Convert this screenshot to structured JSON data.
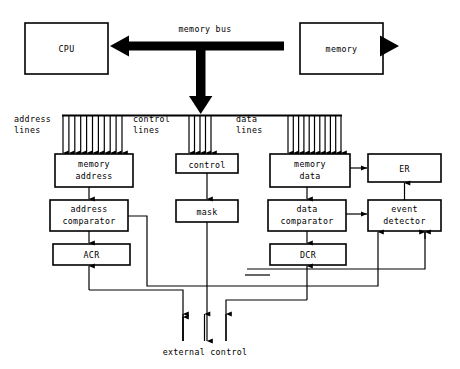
{
  "diagram": {
    "colors": {
      "ink": "#000000",
      "paper": "#ffffff"
    },
    "top": {
      "cpu_label": "CPU",
      "memory_label": "memory",
      "bus_label": "memory bus"
    },
    "bus_groups": [
      {
        "id": "address",
        "label_line1": "address",
        "label_line2": "lines",
        "count": 11
      },
      {
        "id": "control",
        "label_line1": "control",
        "label_line2": "lines",
        "count": 5
      },
      {
        "id": "data",
        "label_line1": "data",
        "label_line2": "lines",
        "count": 11
      }
    ],
    "boxes": {
      "memory_address": {
        "line1": "memory",
        "line2": "address"
      },
      "control": {
        "line1": "control",
        "line2": ""
      },
      "memory_data": {
        "line1": "memory",
        "line2": "data"
      },
      "er": {
        "line1": "ER",
        "line2": ""
      },
      "address_comparator": {
        "line1": "address",
        "line2": "comparator"
      },
      "mask": {
        "line1": "mask",
        "line2": ""
      },
      "data_comparator": {
        "line1": "data",
        "line2": "comparator"
      },
      "event_detector": {
        "line1": "event",
        "line2": "detector"
      },
      "acr": {
        "line1": "ACR",
        "line2": ""
      },
      "dcr": {
        "line1": "DCR",
        "line2": ""
      }
    },
    "bottom": {
      "external_control_label": "external control",
      "line_count": 3
    }
  }
}
